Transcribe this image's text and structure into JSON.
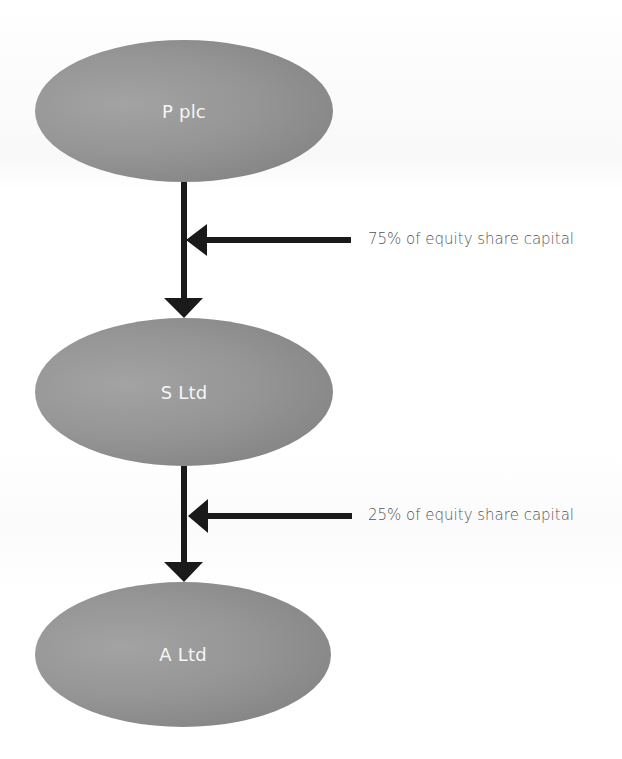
{
  "diagram": {
    "nodes": [
      {
        "id": "p",
        "label": "P plc"
      },
      {
        "id": "s",
        "label": "S Ltd"
      },
      {
        "id": "a",
        "label": "A Ltd"
      }
    ],
    "edges": [
      {
        "from": "P plc",
        "to": "S Ltd",
        "label": "75% of equity share capital"
      },
      {
        "from": "S Ltd",
        "to": "A Ltd",
        "label": "25% of equity share capital"
      }
    ],
    "colors": {
      "node_fill": "#939393",
      "node_text": "#f6f6f6",
      "arrow": "#1a1a1a",
      "edge_text": "#555555",
      "background": "#ffffff"
    }
  }
}
